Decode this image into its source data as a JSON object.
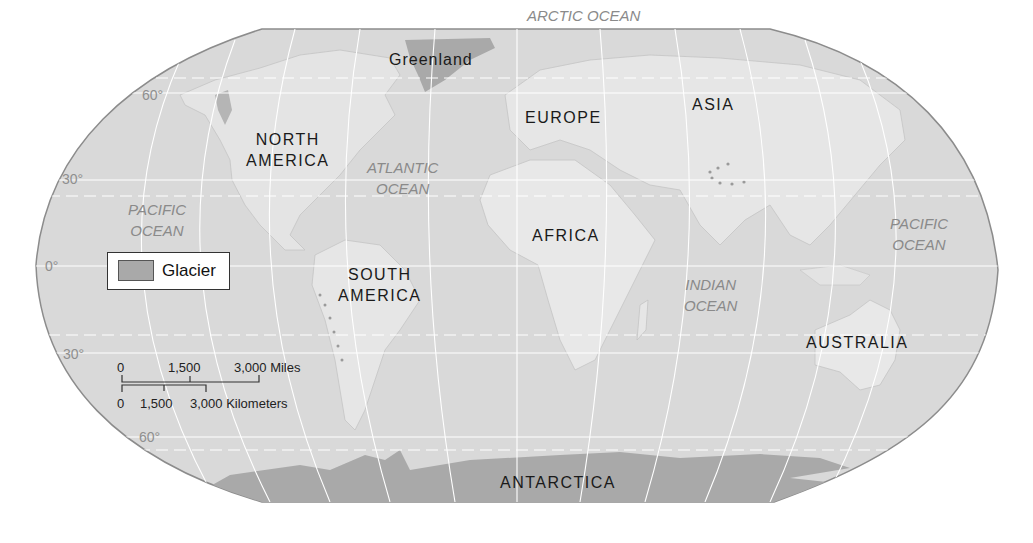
{
  "map": {
    "title": "World map showing glaciers",
    "projection": "Robinson",
    "colors": {
      "background": "#ffffff",
      "ocean": "#d9d9d9",
      "land": "#e6e6e6",
      "glacier": "#a9a9a9",
      "outline": "#8c8c8c",
      "graticule": "#ffffff",
      "continent_label": "#1a1a1a",
      "ocean_label": "#8a8a8a"
    },
    "continents": [
      {
        "name": "Greenland"
      },
      {
        "name": "NORTH AMERICA",
        "lines": [
          "NORTH",
          "AMERICA"
        ]
      },
      {
        "name": "EUROPE"
      },
      {
        "name": "ASIA"
      },
      {
        "name": "AFRICA"
      },
      {
        "name": "SOUTH AMERICA",
        "lines": [
          "SOUTH",
          "AMERICA"
        ]
      },
      {
        "name": "AUSTRALIA"
      },
      {
        "name": "ANTARCTICA"
      }
    ],
    "oceans": [
      {
        "name": "ARCTIC OCEAN",
        "lines": [
          "ARCTIC OCEAN"
        ]
      },
      {
        "name": "ATLANTIC OCEAN",
        "lines": [
          "ATLANTIC",
          "OCEAN"
        ]
      },
      {
        "name": "PACIFIC OCEAN (west)",
        "lines": [
          "PACIFIC",
          "OCEAN"
        ]
      },
      {
        "name": "PACIFIC OCEAN (east)",
        "lines": [
          "PACIFIC",
          "OCEAN"
        ]
      },
      {
        "name": "INDIAN OCEAN",
        "lines": [
          "INDIAN",
          "OCEAN"
        ]
      }
    ],
    "latitude_labels": [
      "60°",
      "30°",
      "0°",
      "30°",
      "60°"
    ],
    "legend": {
      "items": [
        {
          "label": "Glacier",
          "color": "#a9a9a9"
        }
      ]
    },
    "scale_bar": {
      "miles": {
        "ticks": [
          "0",
          "1,500",
          "3,000 Miles"
        ]
      },
      "kilometers": {
        "ticks": [
          "0",
          "1,500",
          "3,000 Kilometers"
        ]
      }
    }
  }
}
